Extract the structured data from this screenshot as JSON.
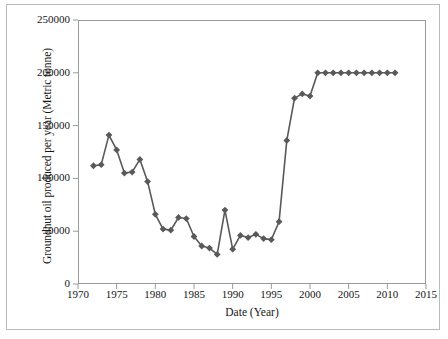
{
  "chart_data": {
    "type": "line",
    "title": "",
    "xlabel": "Date (Year)",
    "ylabel": "Groundnut oil produced per year (Metric tonne)",
    "xlim": [
      1970,
      2015
    ],
    "ylim": [
      0,
      250000
    ],
    "xticks": [
      1970,
      1975,
      1980,
      1985,
      1990,
      1995,
      2000,
      2005,
      2010,
      2015
    ],
    "xtick_labels": [
      "1970",
      "1975",
      "1980",
      "1985",
      "1990",
      "1995",
      "2000",
      "2005",
      "2010",
      "2015"
    ],
    "yticks": [
      0,
      50000,
      100000,
      150000,
      200000,
      250000
    ],
    "ytick_labels": [
      "0",
      "50000",
      "100000",
      "150000",
      "200000",
      "250000"
    ],
    "grid": false,
    "legend": false,
    "marker": "diamond",
    "marker_color": "#595959",
    "line_color": "#595959",
    "series": [
      {
        "name": "Groundnut oil produced per year",
        "x": [
          1972,
          1973,
          1974,
          1975,
          1976,
          1977,
          1978,
          1979,
          1980,
          1981,
          1982,
          1983,
          1984,
          1985,
          1986,
          1987,
          1988,
          1989,
          1990,
          1991,
          1992,
          1993,
          1994,
          1995,
          1996,
          1997,
          1998,
          1999,
          2000,
          2001,
          2002,
          2003,
          2004,
          2005,
          2006,
          2007,
          2008,
          2009,
          2010,
          2011
        ],
        "values": [
          112000,
          113000,
          141000,
          127000,
          105000,
          106000,
          118000,
          97000,
          66000,
          52000,
          51000,
          63000,
          62000,
          45000,
          36000,
          34000,
          28000,
          70000,
          33000,
          46000,
          44000,
          47000,
          43000,
          42000,
          59000,
          136000,
          176000,
          180000,
          178000,
          200000,
          200000,
          200000,
          200000,
          200000,
          200000,
          200000,
          200000,
          200000,
          200000,
          200000
        ]
      }
    ]
  },
  "axis": {
    "ylabel_text": "Groundnut oil produced per year (Metric tonne)",
    "xlabel_text": "Date (Year)"
  }
}
